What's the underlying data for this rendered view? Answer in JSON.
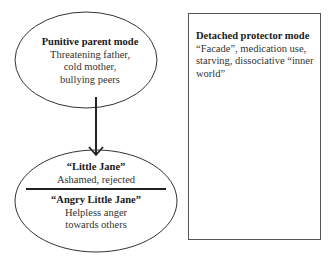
{
  "diagram": {
    "nodes": {
      "punitive_parent": {
        "title": "Punitive parent mode",
        "lines": [
          "Threatening father,",
          "cold mother,",
          "bullying peers"
        ]
      },
      "little_jane": {
        "title": "“Little Jane”",
        "line": "Ashamed, rejected"
      },
      "angry_little_jane": {
        "title": "“Angry Little Jane”",
        "lines": [
          "Helpless anger",
          "towards others"
        ]
      },
      "detached_protector": {
        "title": "Detached protector mode",
        "body": "“Facade”, medication use, starving, dissociative “inner world”"
      }
    },
    "edges": [
      {
        "from": "punitive_parent",
        "to": "little_jane",
        "type": "arrow"
      }
    ],
    "colors": {
      "stroke": "#333333",
      "text": "#333333",
      "background": "#ffffff"
    }
  }
}
